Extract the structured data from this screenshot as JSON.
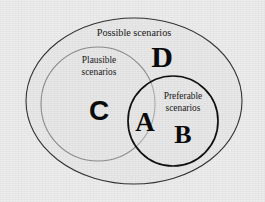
{
  "diagram": {
    "type": "venn",
    "background_color": "#ededed",
    "regions": [
      {
        "id": "possible",
        "label": "Possible scenarios",
        "shape": "ellipse",
        "stroke_color": "#343434",
        "letter": "D",
        "letter_meaning": "possible-only"
      },
      {
        "id": "plausible",
        "label_line1": "Plausible",
        "label_line2": "scenarios",
        "shape": "circle",
        "stroke_color": "#8d8d8d",
        "letter": "C",
        "letter_meaning": "plausible-only"
      },
      {
        "id": "preferable",
        "label_line1": "Preferable",
        "label_line2": "scenarios",
        "shape": "circle",
        "stroke_color": "#121212",
        "letter": "B",
        "letter_meaning": "preferable-only"
      },
      {
        "id": "intersection",
        "label": "",
        "letter": "A",
        "letter_meaning": "plausible-and-preferable"
      }
    ],
    "letters": {
      "a": "A",
      "b": "B",
      "c": "C",
      "d": "D"
    },
    "labels": {
      "possible": "Possible scenarios",
      "plausible_line1": "Plausible",
      "plausible_line2": "scenarios",
      "preferable_line1": "Preferable",
      "preferable_line2": "scenarios"
    }
  }
}
